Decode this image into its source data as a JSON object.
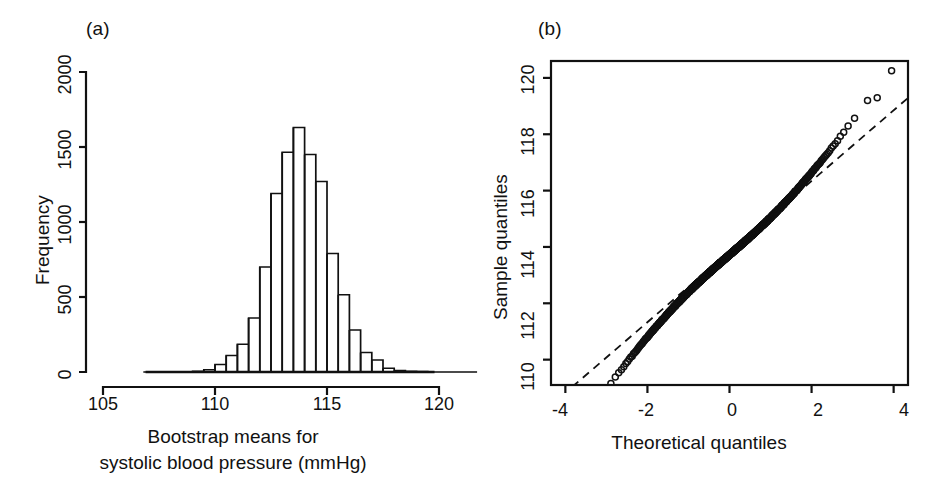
{
  "figure": {
    "background": "#ffffff",
    "ink_color": "#111111",
    "panels": [
      {
        "tag": "(a)",
        "type": "histogram",
        "xlabel_line1": "Bootstrap means for",
        "xlabel_line2": "systolic blood pressure (mmHg)",
        "ylabel": "Frequency"
      },
      {
        "tag": "(b)",
        "type": "qq",
        "xlabel": "Theoretical quantiles",
        "ylabel": "Sample quantiles"
      }
    ]
  },
  "chart_data": [
    {
      "type": "bar",
      "panel": "(a)",
      "title": "",
      "subtitle": "",
      "xlabel": "Bootstrap means for systolic blood pressure (mmHg)",
      "ylabel": "Frequency",
      "xlim": [
        105,
        120
      ],
      "ylim": [
        0,
        2000
      ],
      "xticks": [
        105,
        110,
        115,
        120
      ],
      "xtick_labels": [
        "105",
        "110",
        "115",
        "120"
      ],
      "yticks": [
        0,
        500,
        1000,
        1500,
        2000
      ],
      "ytick_labels": [
        "0",
        "500",
        "1000",
        "1500",
        "2000"
      ],
      "grid": false,
      "legend": "none",
      "bin_width": 0.5,
      "bin_edges": [
        109.0,
        109.5,
        110.0,
        110.5,
        111.0,
        111.5,
        112.0,
        112.5,
        113.0,
        113.5,
        114.0,
        114.5,
        115.0,
        115.5,
        116.0,
        116.5,
        117.0,
        117.5,
        118.0,
        118.5,
        119.0,
        119.5
      ],
      "categories": [
        "109.0-109.5",
        "109.5-110.0",
        "110.0-110.5",
        "110.5-111.0",
        "111.0-111.5",
        "111.5-112.0",
        "112.0-112.5",
        "112.5-113.0",
        "113.0-113.5",
        "113.5-114.0",
        "114.0-114.5",
        "114.5-115.0",
        "115.0-115.5",
        "115.5-116.0",
        "116.0-116.5",
        "116.5-117.0",
        "117.0-117.5",
        "117.5-118.0",
        "118.0-118.5",
        "118.5-119.0",
        "119.0-119.5"
      ],
      "values": [
        5,
        15,
        50,
        110,
        185,
        360,
        700,
        1190,
        1465,
        1630,
        1450,
        1270,
        790,
        515,
        280,
        130,
        80,
        25,
        10,
        5,
        2
      ]
    },
    {
      "type": "scatter",
      "panel": "(b)",
      "title": "",
      "xlabel": "Theoretical quantiles",
      "ylabel": "Sample quantiles",
      "xlim": [
        -4.35,
        4.35
      ],
      "ylim": [
        109.1,
        120.6
      ],
      "xticks": [
        -4,
        -2,
        0,
        2,
        4
      ],
      "xtick_labels": [
        "-4",
        "-2",
        "0",
        "2",
        "4"
      ],
      "yticks": [
        110,
        112,
        114,
        116,
        118,
        120
      ],
      "ytick_labels": [
        "110",
        "112",
        "114",
        "116",
        "118",
        "120"
      ],
      "grid": false,
      "legend": "none",
      "reference_line": {
        "style": "dashed",
        "slope_points": [
          [
            -3.7,
            109.2
          ],
          [
            4.0,
            118.85
          ]
        ]
      },
      "marker": "open-circle",
      "n_points": 10000,
      "note": "Points fall close to the dashed reference line; both tails bend slightly above it, with two clear high outliers near theoretical quantiles 3.6 and 3.95."
    }
  ]
}
